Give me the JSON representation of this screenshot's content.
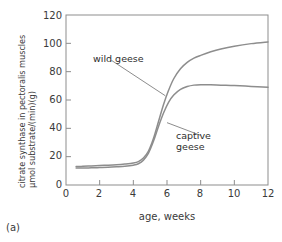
{
  "chart_data": {
    "type": "line",
    "title": "",
    "xlabel": "age, weeks",
    "ylabel_line1": "citrate synthase in pectoralis muscles",
    "ylabel_line2": "μmol substrate/(min)(g)",
    "panel_label": "(a)",
    "xlim": [
      0,
      12
    ],
    "ylim": [
      0,
      120
    ],
    "xticks": [
      0,
      2,
      4,
      6,
      8,
      10,
      12
    ],
    "yticks": [
      0,
      20,
      40,
      60,
      80,
      100,
      120
    ],
    "xtick_labels": [
      "0",
      "2",
      "4",
      "6",
      "8",
      "10",
      "12"
    ],
    "ytick_labels": [
      "0",
      "20",
      "40",
      "60",
      "80",
      "100",
      "120"
    ],
    "grid": false,
    "legend_position": "inline-annotations",
    "series_color": "#8d8d8d",
    "series": [
      {
        "name": "wild geese",
        "label": "wild geese",
        "x": [
          0.6,
          1.0,
          1.5,
          2.0,
          2.5,
          3.0,
          3.5,
          4.0,
          4.3,
          4.6,
          4.9,
          5.2,
          5.5,
          5.8,
          6.1,
          6.4,
          6.8,
          7.2,
          7.6,
          8.0,
          8.6,
          9.2,
          10.0,
          11.0,
          12.0
        ],
        "values": [
          13.0,
          13.2,
          13.5,
          13.8,
          14.0,
          14.3,
          14.8,
          15.5,
          16.5,
          19.0,
          24.0,
          33.0,
          45.0,
          57.0,
          67.0,
          75.0,
          82.0,
          86.5,
          89.5,
          91.5,
          94.0,
          96.0,
          98.0,
          99.8,
          101.0
        ]
      },
      {
        "name": "captive geese",
        "label": "captive\ngeese",
        "label_line1": "captive",
        "label_line2": "geese",
        "x": [
          0.6,
          1.0,
          1.5,
          2.0,
          2.5,
          3.0,
          3.5,
          4.0,
          4.3,
          4.6,
          4.9,
          5.2,
          5.5,
          5.8,
          6.1,
          6.4,
          6.8,
          7.2,
          7.6,
          8.0,
          8.6,
          9.2,
          10.0,
          11.0,
          12.0
        ],
        "values": [
          12.0,
          12.0,
          12.1,
          12.3,
          12.5,
          12.8,
          13.2,
          14.0,
          15.0,
          17.5,
          22.5,
          31.0,
          41.5,
          51.0,
          58.5,
          63.5,
          67.5,
          69.5,
          70.5,
          70.8,
          70.8,
          70.5,
          70.2,
          69.6,
          69.0
        ]
      }
    ],
    "annotations": [
      {
        "text": "wild geese",
        "x": 2.7,
        "y": 88,
        "leader_to_x": 5.9,
        "leader_to_y": 63
      },
      {
        "text": "captive geese",
        "x": 8.0,
        "y": 35,
        "leader_to_x": 6.0,
        "leader_to_y": 44
      }
    ]
  },
  "frame": {
    "axis_color": "#8d8d8d",
    "plot_bg": "#ffffff"
  }
}
